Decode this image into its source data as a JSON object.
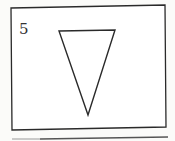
{
  "figure": {
    "label": "5",
    "shape": "inverted-triangle",
    "stroke_color": "#2a2a2a",
    "background": "#fbfbf9"
  }
}
